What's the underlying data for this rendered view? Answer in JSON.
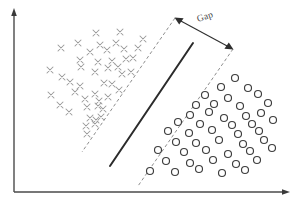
{
  "figure": {
    "title": "",
    "annotation_label": "Gap",
    "colors": {
      "axis": "#4a4a4a",
      "boundary": "#2b2b2b",
      "margin": "#8d8d8d",
      "cross": "#9a9a9a",
      "circle": "#3d3d3d",
      "background": "#ffffff"
    }
  },
  "chart_data": {
    "type": "scatter",
    "title": "",
    "xlabel": "",
    "ylabel": "",
    "xlim": [
      0,
      293
    ],
    "ylim": [
      0,
      204
    ],
    "grid": false,
    "legend": "none",
    "axes": {
      "x_axis": {
        "x1": 14,
        "y1": 192,
        "x2": 288,
        "y2": 192,
        "arrow": "right"
      },
      "y_axis": {
        "x1": 14,
        "y1": 192,
        "x2": 14,
        "y2": 11,
        "arrow": "up"
      }
    },
    "series": [
      {
        "name": "class-cross",
        "marker": "x",
        "color": "#9a9a9a",
        "size": 6,
        "points": [
          [
            96,
            33
          ],
          [
            120,
            32
          ],
          [
            78,
            43
          ],
          [
            100,
            45
          ],
          [
            116,
            43
          ],
          [
            143,
            39
          ],
          [
            61,
            48
          ],
          [
            90,
            52
          ],
          [
            107,
            50
          ],
          [
            124,
            49
          ],
          [
            138,
            48
          ],
          [
            80,
            60
          ],
          [
            98,
            62
          ],
          [
            112,
            61
          ],
          [
            126,
            59
          ],
          [
            133,
            58
          ],
          [
            50,
            70
          ],
          [
            81,
            67
          ],
          [
            108,
            68
          ],
          [
            118,
            67
          ],
          [
            62,
            77
          ],
          [
            95,
            72
          ],
          [
            122,
            74
          ],
          [
            131,
            72
          ],
          [
            70,
            82
          ],
          [
            80,
            86
          ],
          [
            104,
            83
          ],
          [
            112,
            84
          ],
          [
            51,
            95
          ],
          [
            75,
            92
          ],
          [
            95,
            94
          ],
          [
            119,
            90
          ],
          [
            85,
            99
          ],
          [
            99,
            101
          ],
          [
            108,
            97
          ],
          [
            60,
            105
          ],
          [
            87,
            107
          ],
          [
            98,
            106
          ],
          [
            103,
            109
          ],
          [
            69,
            112
          ],
          [
            90,
            118
          ],
          [
            96,
            120
          ],
          [
            101,
            117
          ],
          [
            86,
            126
          ],
          [
            95,
            124
          ],
          [
            87,
            134
          ]
        ]
      },
      {
        "name": "class-circle",
        "marker": "o",
        "color": "#3d3d3d",
        "size": 7,
        "points": [
          [
            235,
            78
          ],
          [
            221,
            87
          ],
          [
            248,
            88
          ],
          [
            205,
            95
          ],
          [
            228,
            98
          ],
          [
            258,
            94
          ],
          [
            196,
            105
          ],
          [
            214,
            104
          ],
          [
            240,
            106
          ],
          [
            268,
            103
          ],
          [
            190,
            115
          ],
          [
            209,
            112
          ],
          [
            224,
            118
          ],
          [
            246,
            116
          ],
          [
            261,
            113
          ],
          [
            178,
            122
          ],
          [
            200,
            124
          ],
          [
            232,
            125
          ],
          [
            252,
            124
          ],
          [
            273,
            120
          ],
          [
            168,
            131
          ],
          [
            189,
            133
          ],
          [
            212,
            130
          ],
          [
            238,
            134
          ],
          [
            259,
            131
          ],
          [
            176,
            142
          ],
          [
            196,
            143
          ],
          [
            219,
            140
          ],
          [
            243,
            144
          ],
          [
            264,
            140
          ],
          [
            158,
            150
          ],
          [
            184,
            152
          ],
          [
            206,
            150
          ],
          [
            228,
            154
          ],
          [
            250,
            151
          ],
          [
            272,
            148
          ],
          [
            166,
            161
          ],
          [
            190,
            163
          ],
          [
            213,
            160
          ],
          [
            236,
            164
          ],
          [
            257,
            160
          ],
          [
            150,
            171
          ],
          [
            175,
            172
          ],
          [
            199,
            169
          ],
          [
            222,
            173
          ],
          [
            245,
            170
          ]
        ]
      }
    ],
    "annotations": {
      "margin_line_left": {
        "x1": 175,
        "y1": 18,
        "x2": 82,
        "y2": 152
      },
      "margin_line_right": {
        "x1": 233,
        "y1": 49,
        "x2": 138,
        "y2": 186
      },
      "decision_boundary": {
        "x1": 193,
        "y1": 43,
        "x2": 110,
        "y2": 166
      },
      "gap_arrow": {
        "x1": 175,
        "y1": 18,
        "x2": 233,
        "y2": 49,
        "double_headed": true
      },
      "gap_text": {
        "label": "Gap",
        "x": 206,
        "y": 16,
        "rotation": -18
      }
    }
  }
}
